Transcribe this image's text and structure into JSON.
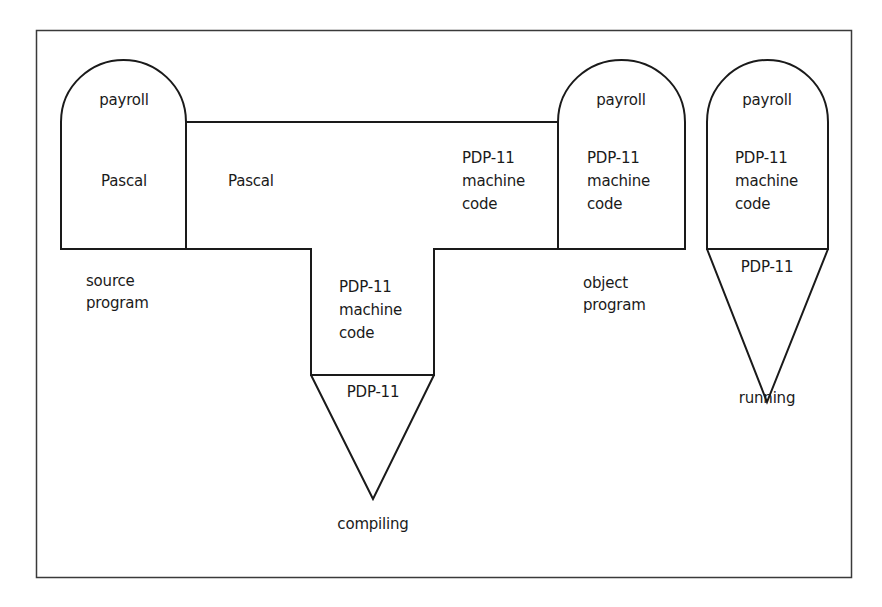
{
  "diagram": {
    "type": "T-diagram (compiler bootstrapping)",
    "colors": {
      "line": "#1a1a1a",
      "background": "#ffffff"
    },
    "source_program": {
      "top": "payroll",
      "middle": "Pascal",
      "caption_line1": "source",
      "caption_line2": "program"
    },
    "compiler": {
      "left_arm": "Pascal",
      "right_arm_line1": "PDP-11",
      "right_arm_line2": "machine",
      "right_arm_line3": "code",
      "stem_line1": "PDP-11",
      "stem_line2": "machine",
      "stem_line3": "code",
      "machine": "PDP-11",
      "caption": "compiling"
    },
    "object_program": {
      "top": "payroll",
      "line1": "PDP-11",
      "line2": "machine",
      "line3": "code",
      "caption_line1": "object",
      "caption_line2": "program"
    },
    "running": {
      "top": "payroll",
      "line1": "PDP-11",
      "line2": "machine",
      "line3": "code",
      "machine": "PDP-11",
      "caption": "running"
    }
  }
}
